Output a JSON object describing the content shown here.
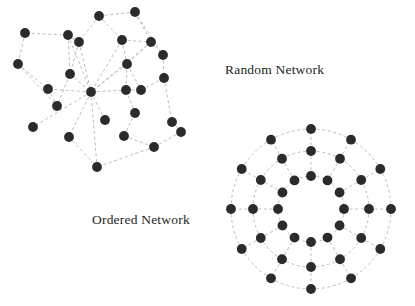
{
  "figure": {
    "width": 415,
    "height": 306,
    "background": "#ffffff"
  },
  "style": {
    "node_color": "#2b2b2b",
    "node_radius": 4.9,
    "edge_color": "#bdbdbd",
    "edge_width": 1.0,
    "edge_dash": "3,2.6",
    "label_color": "#231f20"
  },
  "labels": {
    "random": "Random Network",
    "ordered": "Ordered Network"
  },
  "chart_data": {
    "type": "scatter",
    "title": "",
    "xlabel": "",
    "ylabel": "",
    "graphs": [
      {
        "name": "random-network",
        "label": "Random Network",
        "node_count": 26,
        "edge_count": 43,
        "nodes": [
          [
            99,
            16
          ],
          [
            135,
            12
          ],
          [
            68,
            35
          ],
          [
            25,
            33
          ],
          [
            79,
            42
          ],
          [
            122,
            40
          ],
          [
            151,
            42
          ],
          [
            18,
            64
          ],
          [
            163,
            55
          ],
          [
            70,
            74
          ],
          [
            127,
            64
          ],
          [
            91,
            92
          ],
          [
            48,
            89
          ],
          [
            126,
            90
          ],
          [
            141,
            90
          ],
          [
            164,
            78
          ],
          [
            33,
            127
          ],
          [
            135,
            113
          ],
          [
            172,
            122
          ],
          [
            69,
            137
          ],
          [
            124,
            136
          ],
          [
            154,
            147
          ],
          [
            181,
            132
          ],
          [
            97,
            167
          ],
          [
            57,
            106
          ],
          [
            105,
            120
          ]
        ],
        "edges": [
          [
            0,
            1
          ],
          [
            0,
            5
          ],
          [
            0,
            4
          ],
          [
            1,
            6
          ],
          [
            1,
            8
          ],
          [
            2,
            3
          ],
          [
            2,
            4
          ],
          [
            2,
            9
          ],
          [
            3,
            7
          ],
          [
            4,
            9
          ],
          [
            4,
            11
          ],
          [
            5,
            6
          ],
          [
            5,
            10
          ],
          [
            5,
            11
          ],
          [
            6,
            8
          ],
          [
            6,
            10
          ],
          [
            7,
            12
          ],
          [
            7,
            24
          ],
          [
            8,
            15
          ],
          [
            9,
            11
          ],
          [
            9,
            24
          ],
          [
            10,
            11
          ],
          [
            10,
            13
          ],
          [
            10,
            14
          ],
          [
            11,
            12
          ],
          [
            11,
            13
          ],
          [
            11,
            16
          ],
          [
            11,
            19
          ],
          [
            11,
            23
          ],
          [
            11,
            25
          ],
          [
            12,
            24
          ],
          [
            13,
            14
          ],
          [
            13,
            17
          ],
          [
            14,
            15
          ],
          [
            15,
            18
          ],
          [
            17,
            20
          ],
          [
            18,
            22
          ],
          [
            19,
            23
          ],
          [
            20,
            21
          ],
          [
            21,
            22
          ],
          [
            21,
            23
          ],
          [
            2,
            11
          ],
          [
            6,
            11
          ]
        ]
      },
      {
        "name": "ordered-network",
        "label": "Ordered Network",
        "center": [
          311,
          209
        ],
        "rings": [
          {
            "radius": 33,
            "node_count": 12,
            "angle_offset": 0
          },
          {
            "radius": 58,
            "node_count": 12,
            "angle_offset": 0
          },
          {
            "radius": 80,
            "node_count": 12,
            "angle_offset": 0
          }
        ],
        "node_count": 36,
        "edge_count": 72,
        "description": "Three concentric rings of 12 nodes each, connected circumferentially within each ring and radially between rings"
      }
    ]
  }
}
